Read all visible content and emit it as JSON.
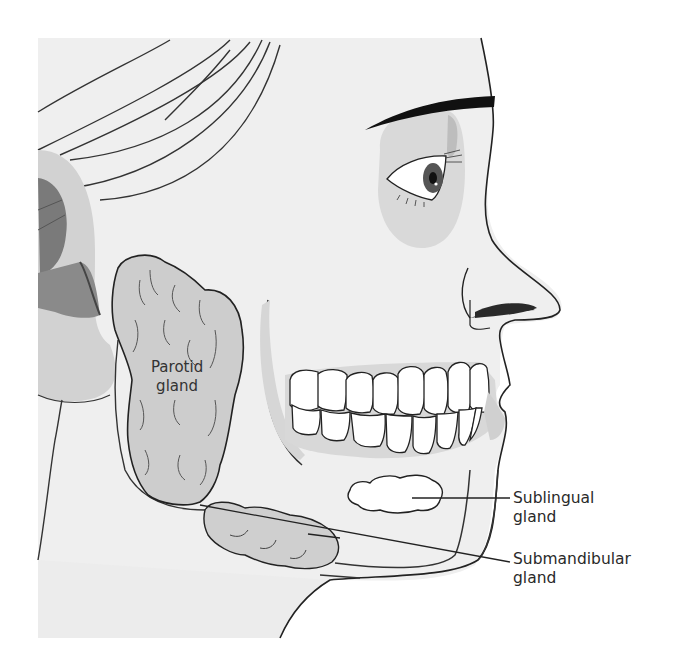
{
  "diagram": {
    "colors": {
      "background": "#ffffff",
      "skin": "#efefef",
      "gland_fill": "#cfcfcf",
      "ear_dark": "#8a8a8a",
      "ear_mid": "#bdbdbd",
      "eye_shadow": "#d6d6d6",
      "outline": "#222222",
      "teeth": "#ffffff",
      "eyebrow": "#111111"
    },
    "labels": {
      "parotid": {
        "line1": "Parotid",
        "line2": "gland"
      },
      "sublingual": {
        "line1": "Sublingual",
        "line2": "gland"
      },
      "submandibular": {
        "line1": "Submandibular",
        "line2": "gland"
      }
    },
    "structures": [
      "parotid-gland",
      "sublingual-gland",
      "submandibular-gland",
      "ear",
      "eye",
      "eyebrow",
      "nose",
      "teeth",
      "jaw",
      "hair"
    ]
  }
}
